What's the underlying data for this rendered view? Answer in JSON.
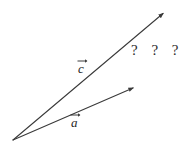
{
  "figure": {
    "background_color": "#ffffff",
    "stroke_color": "#3a3a3a",
    "text_color": "#262626",
    "width": 180,
    "height": 148
  },
  "origin": {
    "label": "common-origin",
    "x": 13,
    "y": 140
  },
  "vectors": [
    {
      "id": "vector-c",
      "label": "c",
      "has_arrow_accent": true,
      "from": {
        "x": 13,
        "y": 140
      },
      "to": {
        "x": 165,
        "y": 12
      },
      "label_position": {
        "x": 78,
        "y": 60
      }
    },
    {
      "id": "vector-a",
      "label": "a",
      "has_arrow_accent": true,
      "from": {
        "x": 13,
        "y": 140
      },
      "to": {
        "x": 135,
        "y": 87
      },
      "label_position": {
        "x": 71,
        "y": 114
      }
    }
  ],
  "annotations": {
    "unknown_marks": "? ? ?"
  }
}
